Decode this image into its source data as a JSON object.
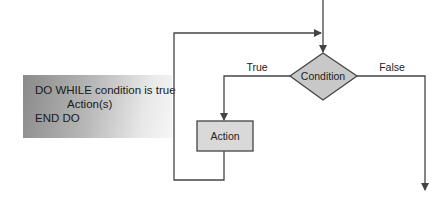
{
  "pseudocode": {
    "line1": "DO WHILE condition is true",
    "line2": "Action(s)",
    "line3": "END DO"
  },
  "flowchart": {
    "decision_label": "Condition",
    "process_label": "Action",
    "true_label": "True",
    "false_label": "False",
    "colors": {
      "shape_fill_decision": "#c8c8c8",
      "shape_fill_process": "#d9d9d9",
      "line": "#444444"
    }
  }
}
